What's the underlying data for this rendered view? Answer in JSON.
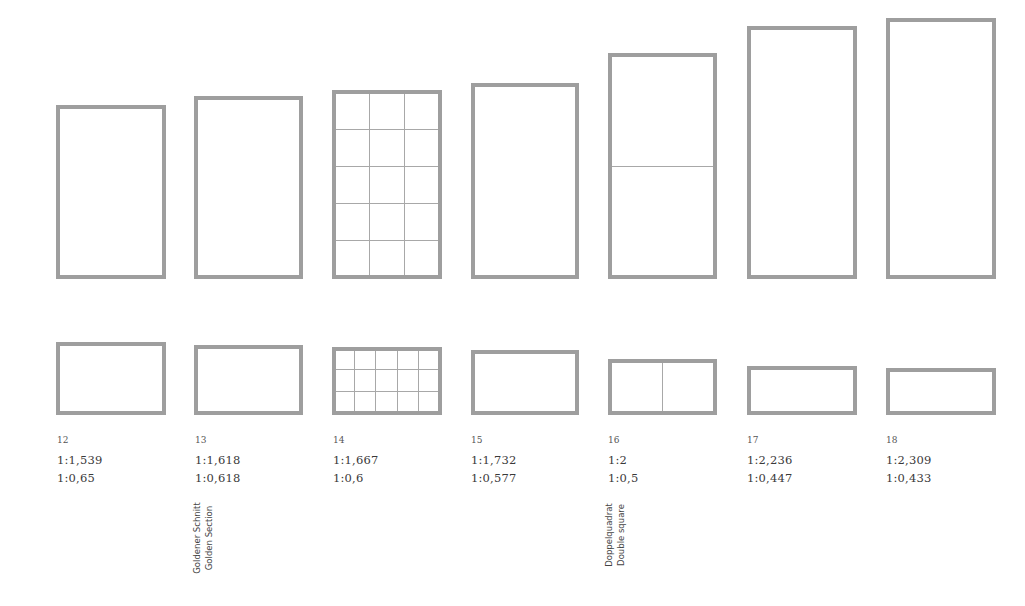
{
  "style": {
    "border_color": "#9e9e9e",
    "grid_line_color": "#a8a8a8",
    "text_color": "#3a3a3a"
  },
  "items": [
    {
      "id": "12",
      "ratio": "1:1,539",
      "inverse": "1:0,65",
      "label_de": "",
      "label_en": ""
    },
    {
      "id": "13",
      "ratio": "1:1,618",
      "inverse": "1:0,618",
      "label_de": "Goldener Schnitt",
      "label_en": "Golden Section"
    },
    {
      "id": "14",
      "ratio": "1:1,667",
      "inverse": "1:0,6",
      "label_de": "",
      "label_en": "",
      "grid": "3 x 5 modules"
    },
    {
      "id": "15",
      "ratio": "1:1,732",
      "inverse": "1:0,577",
      "label_de": "",
      "label_en": ""
    },
    {
      "id": "16",
      "ratio": "1:2",
      "inverse": "1:0,5",
      "label_de": "Doppelquadrat",
      "label_en": "Double square",
      "grid": "2 squares"
    },
    {
      "id": "17",
      "ratio": "1:2,236",
      "inverse": "1:0,447",
      "label_de": "",
      "label_en": ""
    },
    {
      "id": "18",
      "ratio": "1:2,309",
      "inverse": "1:0,433",
      "label_de": "",
      "label_en": ""
    }
  ]
}
